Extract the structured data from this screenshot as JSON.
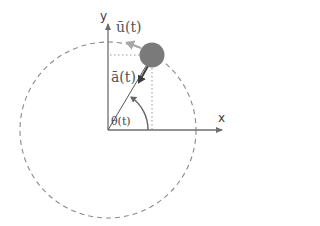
{
  "diagram": {
    "type": "circular-motion",
    "labels": {
      "x_axis": "x",
      "y_axis": "y",
      "velocity": "ū(t)",
      "acceleration": "ā(t)",
      "angle": "θ(t)"
    },
    "geometry": {
      "origin": [
        108,
        130
      ],
      "circle_radius": 88,
      "particle_center": [
        152,
        55
      ],
      "particle_radius": 13
    },
    "colors": {
      "axes": "#6e6e6e",
      "circle_dashed": "#8a8a8a",
      "particle": "#7a7a7a",
      "velocity_arrow": "#a8a8a8",
      "acceleration_arrow": "#3c3c3c",
      "radius_line": "#555555",
      "angle_arc": "#666666",
      "projection_dotted": "#9a9a9a"
    }
  }
}
